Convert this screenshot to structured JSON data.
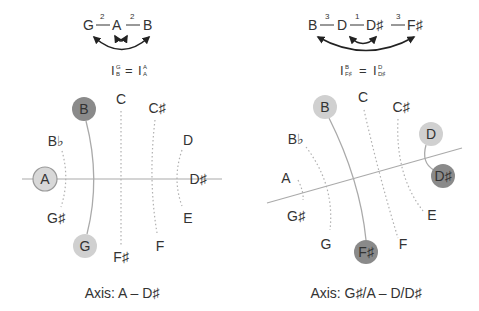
{
  "left": {
    "sequence": {
      "notes": [
        "G",
        "A",
        "B"
      ],
      "intervals": [
        "2",
        "2"
      ]
    },
    "equation": {
      "lhs": "I",
      "lhs_sup": "G",
      "lhs_sub": "B",
      "eq": "=",
      "rhs": "I",
      "rhs_sup": "A",
      "rhs_sub": "A"
    },
    "circle": {
      "labels": {
        "C": "C",
        "Cs": "C♯",
        "D": "D",
        "Ds": "D♯",
        "E": "E",
        "F": "F",
        "Fs": "F♯",
        "G": "G",
        "Gs": "G♯",
        "A": "A",
        "Bb": "B♭",
        "B": "B"
      }
    },
    "caption": "Axis: A – D♯"
  },
  "right": {
    "sequence": {
      "notes": [
        "B",
        "D",
        "D♯",
        "F♯"
      ],
      "intervals": [
        "3",
        "1",
        "3"
      ]
    },
    "equation": {
      "lhs": "I",
      "lhs_sup": "B",
      "lhs_sub": "F♯",
      "eq": "=",
      "rhs": "I",
      "rhs_sup": "D",
      "rhs_sub": "D♯"
    },
    "circle": {
      "labels": {
        "C": "C",
        "Cs": "C♯",
        "D": "D",
        "Ds": "D♯",
        "E": "E",
        "F": "F",
        "Fs": "F♯",
        "G": "G",
        "Gs": "G♯",
        "A": "A",
        "Bb": "B♭",
        "B": "B"
      }
    },
    "caption": "Axis: G♯/A – D/D♯"
  },
  "colors": {
    "dark_circle": "#8a8a8a",
    "light_circle": "#d0d0d0",
    "line": "#aaaaaa",
    "dotted": "#b0b0b0",
    "arrow": "#222222"
  }
}
